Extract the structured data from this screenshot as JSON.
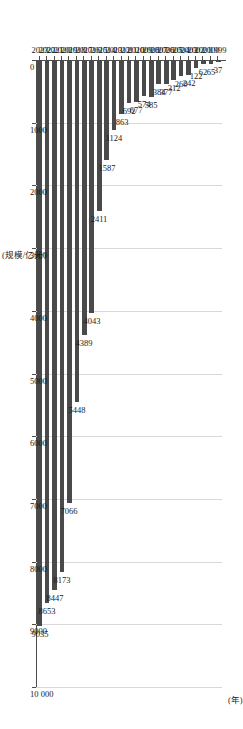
{
  "chart_data": {
    "type": "bar",
    "orientation": "horizontal",
    "title": "",
    "xlabel": "(规模/亿元)",
    "ylabel": "(年)",
    "xlim": [
      0,
      10000
    ],
    "grid": true,
    "legend": null,
    "bar_color": "#4a4a4a",
    "axis_color": "#4d4d4d",
    "gridline_color": "#d9d9d9",
    "xticks": [
      "0",
      "1000",
      "2000",
      "3000",
      "4000",
      "5000",
      "6000",
      "7000",
      "8000",
      "9000",
      "10 000"
    ],
    "xtick_values": [
      0,
      1000,
      2000,
      3000,
      4000,
      5000,
      6000,
      7000,
      8000,
      9000,
      10000
    ],
    "categories": [
      "1999",
      "2000",
      "2001",
      "2002",
      "2003",
      "2004",
      "2005",
      "2006",
      "2007",
      "2008",
      "2009",
      "2010",
      "2011",
      "2012",
      "2013",
      "2014",
      "2015",
      "2016",
      "2017",
      "2018",
      "2019",
      "2020",
      "2021",
      "2022",
      "2023"
    ],
    "values": [
      37,
      65,
      62,
      122,
      242,
      260,
      312,
      377,
      384,
      585,
      574,
      677,
      692,
      863,
      1124,
      1587,
      2411,
      4043,
      4389,
      5448,
      7066,
      8173,
      8447,
      8653,
      9035
    ],
    "data_labels": [
      "37",
      "65",
      "62",
      "122",
      "242",
      "260",
      "312",
      "377",
      "384",
      "585",
      "574",
      "677",
      "692",
      "863",
      "1124",
      "1587",
      "2411",
      "4043",
      "4389",
      "5448",
      "7066",
      "8173",
      "8447",
      "8653",
      "9035"
    ]
  }
}
